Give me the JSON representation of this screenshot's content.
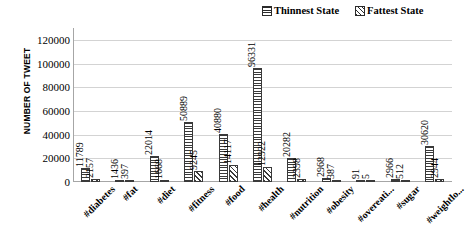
{
  "chart_data": {
    "type": "bar",
    "title": "",
    "xlabel": "",
    "ylabel": "NUMBER OF TWEET",
    "ylim": [
      0,
      130000
    ],
    "yticks": [
      0,
      20000,
      40000,
      60000,
      80000,
      100000,
      120000
    ],
    "ytick_labels": [
      "0",
      "20000",
      "40000",
      "60000",
      "80000",
      "100000",
      "120000"
    ],
    "grid": true,
    "legend_position": "top-right",
    "categories": [
      "#diabetes",
      "#fat",
      "#diet",
      "#fitness",
      "#food",
      "#health",
      "#nutrition",
      "#obesity",
      "#overeati...",
      "#sugar",
      "#weightlo..."
    ],
    "series": [
      {
        "name": "Thinnest State",
        "pattern": "horizontal-lines",
        "values": [
          11789,
          1436,
          22014,
          50889,
          40880,
          96331,
          20282,
          2968,
          91,
          2966,
          30620
        ]
      },
      {
        "name": "Fattest State",
        "pattern": "diagonal-hatch",
        "values": [
          2157,
          397,
          1668,
          9245,
          14117,
          12922,
          2398,
          387,
          5,
          512,
          2944
        ]
      }
    ]
  },
  "legend": {
    "entries": [
      {
        "label": "Thinnest State",
        "swatch": "horizontal-lines-swatch"
      },
      {
        "label": "Fattest State",
        "swatch": "diagonal-hatch-swatch"
      }
    ]
  },
  "axis": {
    "y_title": "NUMBER OF TWEET"
  },
  "colors": {
    "hatch": "#3a3a3a",
    "gridline": "#d3d3d3",
    "axis": "#a6a6a6",
    "background": "#ffffff",
    "text": "#000000"
  }
}
